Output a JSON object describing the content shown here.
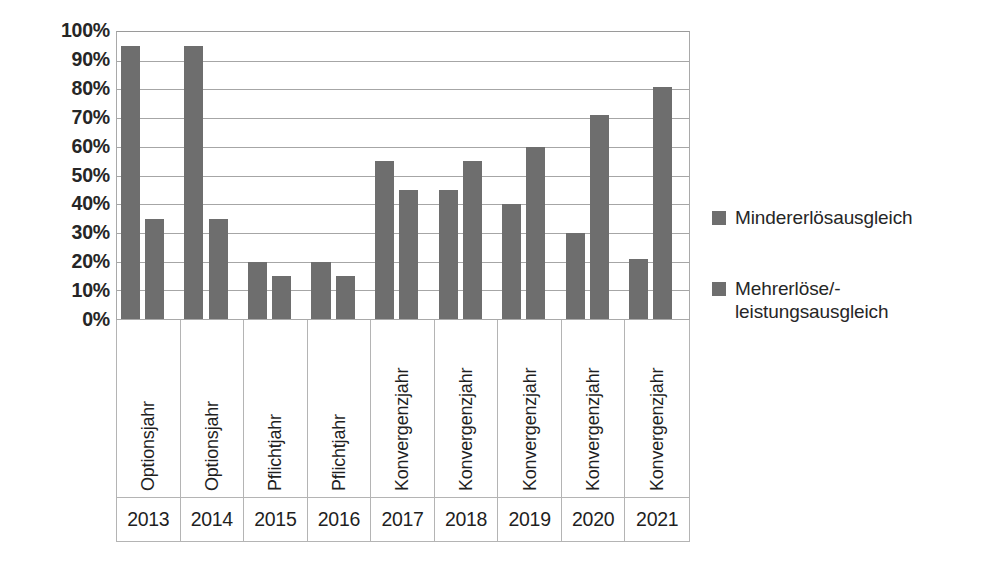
{
  "chart_data": {
    "type": "bar",
    "title": "",
    "xlabel": "",
    "ylabel": "",
    "ylim": [
      0,
      100
    ],
    "yunit": "%",
    "grid": true,
    "legend_position": "right",
    "ytick_labels": [
      "100%",
      "90%",
      "80%",
      "70%",
      "60%",
      "50%",
      "40%",
      "30%",
      "20%",
      "10%",
      "0%"
    ],
    "ytick_values": [
      100,
      90,
      80,
      70,
      60,
      50,
      40,
      30,
      20,
      10,
      0
    ],
    "categories": [
      "2013",
      "2014",
      "2015",
      "2016",
      "2017",
      "2018",
      "2019",
      "2020",
      "2021"
    ],
    "category_types": [
      "Optionsjahr",
      "Optionsjahr",
      "Pflichtjahr",
      "Pflichtjahr",
      "Konvergenzjahr",
      "Konvergenzjahr",
      "Konvergenzjahr",
      "Konvergenzjahr",
      "Konvergenzjahr"
    ],
    "series": [
      {
        "name": "Mindererlösausgleich",
        "color": "#6e6e6e",
        "values": [
          95,
          95,
          20,
          20,
          55,
          45,
          40,
          30,
          21
        ]
      },
      {
        "name": "Mehrerlöse/-\nleistungsausgleich",
        "color": "#6e6e6e",
        "values": [
          35,
          35,
          15,
          15,
          45,
          55,
          60,
          71,
          81
        ]
      }
    ]
  },
  "legend": {
    "entries": [
      {
        "label": "Mindererlösausgleich",
        "color": "#6e6e6e"
      },
      {
        "label": "Mehrerlöse/-\nleistungsausgleich",
        "color": "#6e6e6e"
      }
    ]
  },
  "colors": {
    "bar": "#6e6e6e",
    "gridline": "#a6a6a6",
    "axis_border": "#b4b4b4",
    "text": "#262626",
    "background": "#ffffff"
  }
}
